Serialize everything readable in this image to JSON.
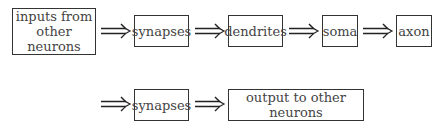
{
  "diagram": {
    "type": "flow",
    "title": "",
    "row1": [
      {
        "id": "inputs",
        "label_line1": "inputs from",
        "label_line2": "other neurons"
      },
      {
        "id": "synapses1",
        "label": "synapses"
      },
      {
        "id": "dendrites",
        "label": "dendrites"
      },
      {
        "id": "soma",
        "label": "soma"
      },
      {
        "id": "axon",
        "label": "axon"
      }
    ],
    "row2": [
      {
        "id": "synapses2",
        "label": "synapses"
      },
      {
        "id": "output",
        "label": "output to other neurons"
      }
    ],
    "arrow_symbol": "double-right-arrow",
    "edges": [
      [
        "inputs",
        "synapses1"
      ],
      [
        "synapses1",
        "dendrites"
      ],
      [
        "dendrites",
        "soma"
      ],
      [
        "soma",
        "axon"
      ],
      [
        "axon",
        "synapses2"
      ],
      [
        "synapses2",
        "output"
      ]
    ]
  }
}
